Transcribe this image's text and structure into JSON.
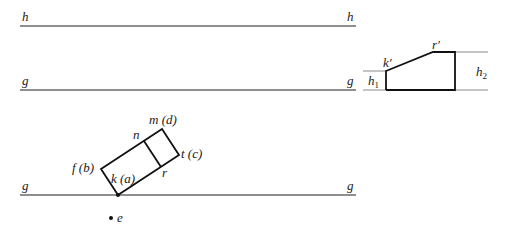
{
  "diagram": {
    "reference_lines": [
      {
        "id": "h-top",
        "label_left": "h",
        "label_right": "h",
        "y": 26,
        "x1": 20,
        "x2": 356
      },
      {
        "id": "g-middle",
        "label_left": "g",
        "label_right": "g",
        "y": 90,
        "x1": 20,
        "x2": 356
      },
      {
        "id": "g-bottom",
        "label_left": "g",
        "label_right": "g",
        "y": 195,
        "x1": 20,
        "x2": 356
      }
    ],
    "rectangle_view": {
      "vertices": {
        "k_a": {
          "label": "k (a)",
          "x": 118,
          "y": 195
        },
        "f_b": {
          "label": "f (b)",
          "x": 101,
          "y": 169
        },
        "m_d": {
          "label": "m (d)",
          "x": 162,
          "y": 129
        },
        "t_c": {
          "label": "t (c)",
          "x": 179,
          "y": 155
        },
        "n": {
          "label": "n",
          "x": 144,
          "y": 141
        },
        "r": {
          "label": "r",
          "x": 161,
          "y": 167
        }
      }
    },
    "point_e": {
      "label": "e",
      "x": 111,
      "y": 218
    },
    "profile_view": {
      "labels": {
        "k_prime": "k′",
        "r_prime": "r′",
        "h1": "h",
        "h1_sub": "1",
        "h2": "h",
        "h2_sub": "2"
      },
      "points": {
        "k_prime": {
          "x": 386,
          "y": 71
        },
        "r_prime": {
          "x": 433,
          "y": 52
        },
        "right_top": {
          "x": 455,
          "y": 52
        },
        "right_bottom": {
          "x": 455,
          "y": 90
        },
        "left_bottom": {
          "x": 386,
          "y": 90
        }
      }
    }
  }
}
